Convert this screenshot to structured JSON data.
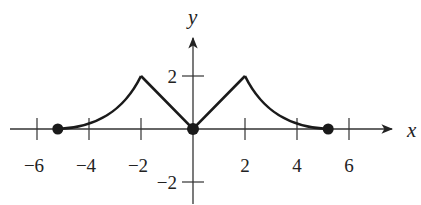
{
  "chart_data": {
    "type": "line",
    "title": "",
    "xlabel": "x",
    "ylabel": "y",
    "xlim": [
      -6.5,
      7
    ],
    "ylim": [
      -2.5,
      3.5
    ],
    "grid": false,
    "legend": null,
    "x_ticks": [
      -6,
      -4,
      -2,
      2,
      4,
      6
    ],
    "x_tick_labels": [
      "−6",
      "−4",
      "−2",
      "2",
      "4",
      "6"
    ],
    "y_ticks": [
      2,
      -2
    ],
    "y_tick_labels": [
      "2",
      "−2"
    ],
    "series": [
      {
        "name": "f(x)",
        "description": "Piecewise: concave-up curve rising from (-5.2,0) to cusp at (-2,2); straight line down to (0,0); straight line up to (2,2); concave-up curve decaying to (5.2,0)",
        "points": [
          [
            -5.2,
            0
          ],
          [
            -4.5,
            0.1
          ],
          [
            -4,
            0.3
          ],
          [
            -3.5,
            0.65
          ],
          [
            -3,
            1.1
          ],
          [
            -2.5,
            1.55
          ],
          [
            -2,
            2
          ],
          [
            -1,
            1
          ],
          [
            0,
            0
          ],
          [
            1,
            1
          ],
          [
            2,
            2
          ],
          [
            2.5,
            1.4
          ],
          [
            3,
            0.9
          ],
          [
            3.5,
            0.55
          ],
          [
            4,
            0.25
          ],
          [
            4.5,
            0.08
          ],
          [
            5.2,
            0
          ]
        ]
      }
    ],
    "marked_points": [
      {
        "x": -5.2,
        "y": 0,
        "style": "filled"
      },
      {
        "x": 0,
        "y": 0,
        "style": "filled"
      },
      {
        "x": 5.2,
        "y": 0,
        "style": "filled"
      }
    ]
  },
  "axes": {
    "x_label": "x",
    "y_label": "y"
  }
}
